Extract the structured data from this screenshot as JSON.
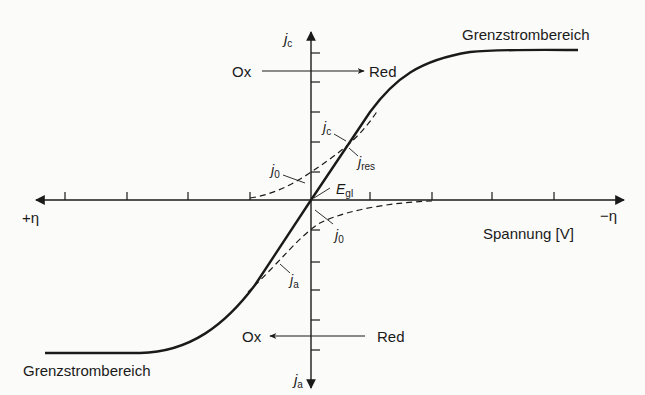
{
  "colors": {
    "background": "#fbfbf9",
    "ink": "#1a1a1a"
  },
  "axes": {
    "y_top_label": {
      "main": "j",
      "sub": "c"
    },
    "y_bottom_label": {
      "main": "j",
      "sub": "a"
    },
    "x_left_label": "+η",
    "x_right_label": "−η",
    "x_title": "Spannung [V]"
  },
  "regions": {
    "upper_limit": "Grenzstrombereich",
    "lower_limit": "Grenzstrombereich"
  },
  "arrows": {
    "upper": {
      "from": "Ox",
      "to": "Red"
    },
    "lower": {
      "from": "Red",
      "to": "Ox"
    }
  },
  "curve_labels": {
    "jc": {
      "main": "j",
      "sub": "c"
    },
    "jres": {
      "main": "j",
      "sub": "res"
    },
    "j0_upper": {
      "main": "j",
      "sub": "0"
    },
    "j0_lower": {
      "main": "j",
      "sub": "0"
    },
    "ja": {
      "main": "j",
      "sub": "a"
    },
    "egl": {
      "main": "E",
      "sub": "gl"
    }
  }
}
